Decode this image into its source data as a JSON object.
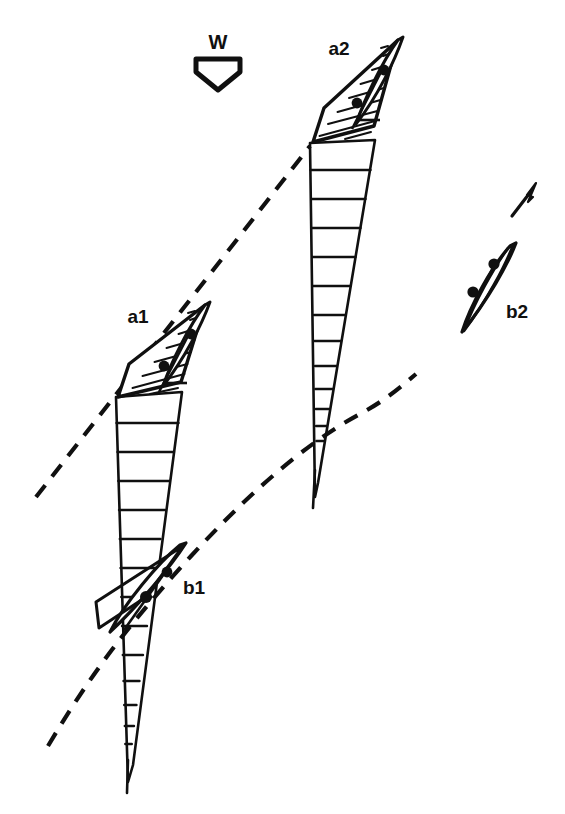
{
  "figure": {
    "kind": "sailing-tactics-diagram",
    "background_color": "#ffffff",
    "ink_color": "#101010"
  },
  "wind": {
    "label": "W",
    "direction": "down",
    "marker": "hollow-pentagon-arrow",
    "x": 218,
    "y": 42
  },
  "boats": [
    {
      "id": "a1",
      "label": "a1",
      "label_x": 138,
      "label_y": 323,
      "has_hatched_sail": true,
      "has_shadow_cone": true,
      "crew_dots": 2,
      "hull_cx": 172,
      "hull_cy": 348
    },
    {
      "id": "a2",
      "label": "a2",
      "label_x": 339,
      "label_y": 55,
      "has_hatched_sail": true,
      "has_shadow_cone": true,
      "crew_dots": 2,
      "hull_cx": 370,
      "hull_cy": 85
    },
    {
      "id": "b1",
      "label": "b1",
      "label_x": 183,
      "label_y": 594,
      "has_hatched_sail": false,
      "has_shadow_cone": false,
      "crew_dots": 2,
      "hull_cx": 150,
      "hull_cy": 590
    },
    {
      "id": "b2",
      "label": "b2",
      "label_x": 506,
      "label_y": 318,
      "has_hatched_sail": false,
      "has_shadow_cone": false,
      "crew_dots": 2,
      "hull_cx": 484,
      "hull_cy": 295
    }
  ],
  "tracks": [
    {
      "id": "track-a",
      "style": "dashed",
      "shape": "straight",
      "from": "lower-left",
      "through": [
        "a1",
        "a2"
      ]
    },
    {
      "id": "track-b",
      "style": "dashed",
      "shape": "curved",
      "from": "lower-left",
      "through": [
        "b1"
      ],
      "toward": "b2"
    }
  ],
  "heading_arrow": {
    "id": "b2-heading-arrow",
    "direction": "up-right",
    "from_x": 512,
    "from_y": 216,
    "to_x": 536,
    "to_y": 184
  },
  "shadow_cones": [
    {
      "id": "cone-a1",
      "owner": "a1",
      "rungs": 13
    },
    {
      "id": "cone-a2",
      "owner": "a2",
      "rungs": 12
    }
  ]
}
